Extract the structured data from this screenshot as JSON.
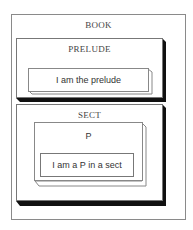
{
  "diagram": {
    "outer": {
      "label": "BOOK"
    },
    "prelude": {
      "label": "PRELUDE",
      "content": "I am the prelude"
    },
    "sect": {
      "label": "SECT",
      "p": {
        "label": "P",
        "content": "I am a P in a sect"
      }
    }
  },
  "colors": {
    "border": "#777777",
    "shadow": "#111111",
    "background": "#ffffff"
  }
}
